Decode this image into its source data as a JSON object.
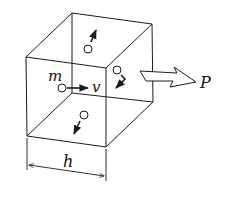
{
  "figure": {
    "type": "diagram",
    "labels": {
      "mass": "m",
      "velocity": "v",
      "pressure": "P",
      "edge_length": "h"
    },
    "stroke_color": "#1a1a1a",
    "background": "#ffffff"
  }
}
